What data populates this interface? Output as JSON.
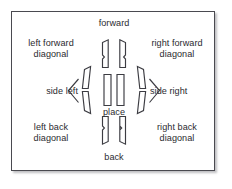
{
  "diagram": {
    "center_label": "place",
    "frame": {
      "border_color": "#4a4a50",
      "background": "#ffffff",
      "shadow_color": "#8c8c91"
    },
    "ink_color": "#3c3c42",
    "text_color": "#2b2b30",
    "directions": [
      {
        "id": "forward",
        "label": "forward",
        "position": "top"
      },
      {
        "id": "back",
        "label": "back",
        "position": "bottom"
      },
      {
        "id": "left-forward-diagonal",
        "label": "left forward\ndiagonal",
        "position": "top-left"
      },
      {
        "id": "right-forward-diagonal",
        "label": "right forward\ndiagonal",
        "position": "top-right"
      },
      {
        "id": "left-back-diagonal",
        "label": "left back\ndiagonal",
        "position": "bottom-left"
      },
      {
        "id": "right-back-diagonal",
        "label": "right back\ndiagonal",
        "position": "bottom-right"
      },
      {
        "id": "side-left",
        "label": "side left",
        "position": "left"
      },
      {
        "id": "side-right",
        "label": "side right",
        "position": "right"
      }
    ],
    "foot_groups": [
      {
        "id": "forward-feet",
        "count": 2,
        "orientation": "up"
      },
      {
        "id": "back-feet",
        "count": 2,
        "orientation": "down"
      },
      {
        "id": "place-feet",
        "count": 2,
        "orientation": "center"
      },
      {
        "id": "side-left-feet",
        "count": 2,
        "orientation": "left-splay"
      },
      {
        "id": "side-right-feet",
        "count": 2,
        "orientation": "right-splay"
      }
    ],
    "arrows": [
      {
        "id": "side-left-arrow",
        "glyph": "left-chevron"
      },
      {
        "id": "side-right-arrow",
        "glyph": "right-chevron"
      }
    ]
  }
}
